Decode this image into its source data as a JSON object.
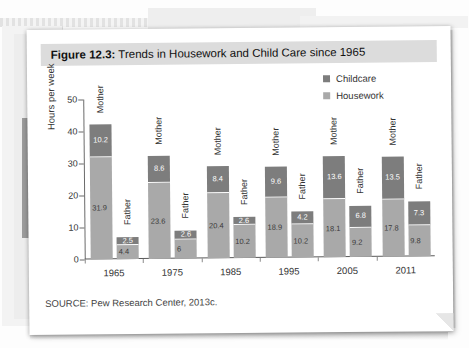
{
  "figure": {
    "label": "Figure 12.3:",
    "title": " Trends in Housework and Child Care since 1965",
    "source": "SOURCE: Pew Research Center, 2013c."
  },
  "colors": {
    "childcare": "#7d7d7d",
    "housework": "#a9a9a9",
    "title_band": "#dcdcdc",
    "page": "#ffffff"
  },
  "chart_data": {
    "type": "bar",
    "stacked": true,
    "title": "Trends in Housework and Child Care since 1965",
    "xlabel": "",
    "ylabel": "Hours per week",
    "ylim": [
      0,
      50
    ],
    "yticks": [
      0,
      10,
      20,
      30,
      40,
      50
    ],
    "grid": false,
    "legend_position": "top-right",
    "categories": [
      "1965",
      "1975",
      "1985",
      "1995",
      "2005",
      "2011"
    ],
    "subcategories": [
      "Mother",
      "Father"
    ],
    "legend": [
      "Childcare",
      "Housework"
    ],
    "series": [
      {
        "name": "Childcare",
        "mother": [
          10.2,
          8.6,
          8.4,
          9.6,
          13.6,
          13.5
        ],
        "father": [
          2.5,
          2.6,
          2.6,
          4.2,
          6.8,
          7.3
        ]
      },
      {
        "name": "Housework",
        "mother": [
          31.9,
          23.6,
          20.4,
          18.9,
          18.1,
          17.8
        ],
        "father": [
          4.4,
          6,
          10.2,
          10.2,
          9.2,
          9.8
        ]
      }
    ],
    "groups": [
      {
        "year": "1965",
        "bars": [
          {
            "who": "Mother",
            "childcare": "10.2",
            "housework": "31.9"
          },
          {
            "who": "Father",
            "childcare": "2.5",
            "housework": "4.4"
          }
        ]
      },
      {
        "year": "1975",
        "bars": [
          {
            "who": "Mother",
            "childcare": "8.6",
            "housework": "23.6"
          },
          {
            "who": "Father",
            "childcare": "2.6",
            "housework": "6"
          }
        ]
      },
      {
        "year": "1985",
        "bars": [
          {
            "who": "Mother",
            "childcare": "8.4",
            "housework": "20.4"
          },
          {
            "who": "Father",
            "childcare": "2.6",
            "housework": "10.2"
          }
        ]
      },
      {
        "year": "1995",
        "bars": [
          {
            "who": "Mother",
            "childcare": "9.6",
            "housework": "18.9"
          },
          {
            "who": "Father",
            "childcare": "4.2",
            "housework": "10.2"
          }
        ]
      },
      {
        "year": "2005",
        "bars": [
          {
            "who": "Mother",
            "childcare": "13.6",
            "housework": "18.1"
          },
          {
            "who": "Father",
            "childcare": "6.8",
            "housework": "9.2"
          }
        ]
      },
      {
        "year": "2011",
        "bars": [
          {
            "who": "Mother",
            "childcare": "13.5",
            "housework": "17.8"
          },
          {
            "who": "Father",
            "childcare": "7.3",
            "housework": "9.8"
          }
        ]
      }
    ]
  }
}
